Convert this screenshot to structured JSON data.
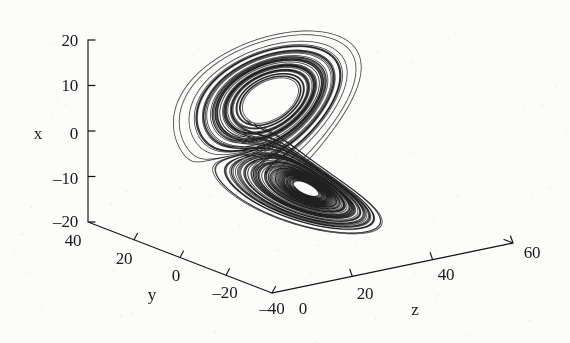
{
  "figure": {
    "background_color": "#fcfcfb",
    "ink_color": "#141414",
    "width": 570,
    "height": 343
  },
  "chart_data": {
    "type": "line",
    "title": "",
    "subtitle": "",
    "projection": "3d",
    "grid": false,
    "legend": null,
    "legend_position": "none",
    "axes": {
      "x": {
        "label": "x",
        "ticks": [
          20,
          10,
          0,
          -10,
          -20
        ],
        "tick_labels": [
          "20",
          "10",
          "0",
          "-10",
          "-20"
        ],
        "lim": [
          -20,
          20
        ],
        "orientation": "vertical-left"
      },
      "y": {
        "label": "y",
        "ticks": [
          40,
          20,
          0,
          -20,
          -40
        ],
        "tick_labels": [
          "40",
          "20",
          "0",
          "-20",
          "-40"
        ],
        "lim": [
          -40,
          40
        ],
        "orientation": "depth-lower-left"
      },
      "z": {
        "label": "z",
        "ticks": [
          0,
          20,
          40,
          60
        ],
        "tick_labels": [
          "0",
          "20",
          "40",
          "60"
        ],
        "lim": [
          0,
          60
        ],
        "orientation": "depth-lower-right"
      }
    },
    "system": {
      "name": "Lorenz",
      "sigma": 10,
      "rho": 28,
      "beta": 2.6667,
      "initial_state": [
        0.8,
        0.8,
        0.8
      ],
      "dt": 0.004,
      "steps": 26000
    },
    "series": [
      {
        "name": "trajectory",
        "color": "#141414",
        "line_width": 0.55,
        "x_range": [
          -19,
          19
        ],
        "y_range": [
          -26,
          26
        ],
        "z_range": [
          2,
          48
        ]
      }
    ]
  },
  "labels": {
    "x_axis_name": "x",
    "y_axis_name": "y",
    "z_axis_name": "z",
    "x_ticks": [
      "20",
      "10",
      "0",
      "–10",
      "–20"
    ],
    "y_ticks": [
      "40",
      "20",
      "0",
      "–20",
      "–40"
    ],
    "z_ticks": [
      "0",
      "20",
      "40",
      "60"
    ]
  }
}
